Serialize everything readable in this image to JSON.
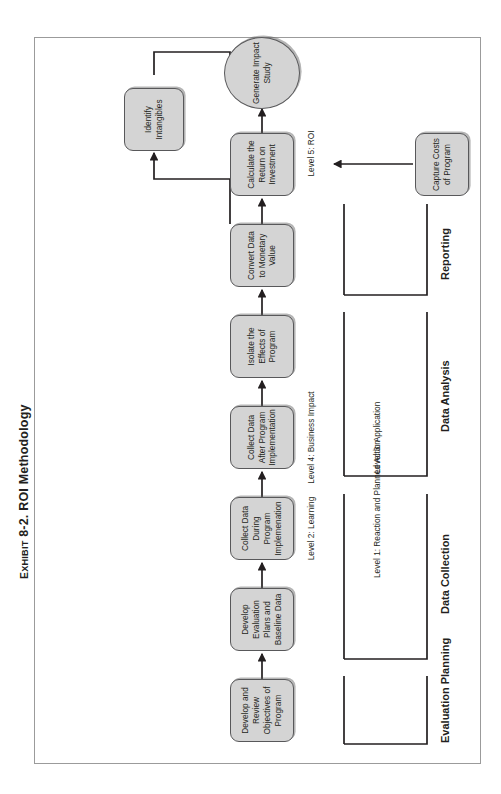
{
  "exhibit": {
    "prefix": "Exhibit",
    "number": "8-2.",
    "title": "ROI Methodology",
    "full_caption": "Exhibit 8-2. ROI Methodology"
  },
  "colors": {
    "node_fill": "#d4d4d4",
    "node_stroke": "#58585a",
    "line": "#231f20",
    "page_border": "#9b9b9b",
    "background": "#ffffff"
  },
  "sections": [
    {
      "id": "evaluation-planning",
      "label": "Evaluation Planning"
    },
    {
      "id": "data-collection",
      "label": "Data Collection"
    },
    {
      "id": "data-analysis",
      "label": "Data Analysis"
    },
    {
      "id": "reporting",
      "label": "Reporting"
    }
  ],
  "nodes": [
    {
      "id": "develop-review-objectives",
      "shape": "box",
      "lines": [
        "Develop and",
        "Review",
        "Objectives of",
        "Program"
      ]
    },
    {
      "id": "develop-evaluation-plans",
      "shape": "box",
      "lines": [
        "Develop",
        "Evaluation",
        "Plans and",
        "Baseline Data"
      ]
    },
    {
      "id": "collect-data-during",
      "shape": "box",
      "lines": [
        "Collect Data",
        "During Program",
        "Implemenation"
      ]
    },
    {
      "id": "collect-data-after",
      "shape": "box",
      "lines": [
        "Collect Data",
        "After Program",
        "Implementation"
      ]
    },
    {
      "id": "isolate-effects",
      "shape": "box",
      "lines": [
        "Isolate the",
        "Effects of",
        "Program"
      ]
    },
    {
      "id": "convert-data-monetary",
      "shape": "box",
      "lines": [
        "Convert Data",
        "to Monetary",
        "Value"
      ]
    },
    {
      "id": "calculate-roi",
      "shape": "box",
      "lines": [
        "Calculate the",
        "Return on",
        "Investment"
      ]
    },
    {
      "id": "generate-impact-study",
      "shape": "oval",
      "lines": [
        "Generate",
        "Impact",
        "Study"
      ]
    },
    {
      "id": "capture-costs",
      "shape": "box",
      "lines": [
        "Capture Costs",
        "of Program"
      ]
    },
    {
      "id": "identify-intangibles",
      "shape": "box",
      "lines": [
        "Identify",
        "Intangibles"
      ]
    }
  ],
  "level_labels": [
    {
      "id": "level-1",
      "lines": [
        "Level 1:",
        "Reaction and",
        "Planned Action"
      ]
    },
    {
      "id": "level-2",
      "lines": [
        "Level 2:",
        "Learning"
      ]
    },
    {
      "id": "level-3",
      "lines": [
        "Level 3:",
        "Application"
      ]
    },
    {
      "id": "level-4",
      "lines": [
        "Level 4:",
        "Business Impact"
      ]
    },
    {
      "id": "level-5",
      "lines": [
        "Level 5: ROI"
      ]
    }
  ]
}
